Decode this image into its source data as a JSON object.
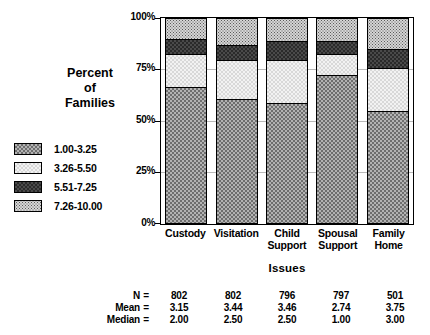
{
  "chart_data": {
    "type": "bar",
    "subtype": "stacked-bar-100-percent",
    "title": "",
    "xlabel": "Issues",
    "ylabel": "Percent of Families",
    "ylim": [
      0,
      100
    ],
    "ytick_labels": [
      "100%",
      "75%",
      "50%",
      "25%",
      "0%"
    ],
    "ytick_values": [
      100,
      75,
      50,
      25,
      0
    ],
    "grid": true,
    "legend_position": "left",
    "categories": [
      "Custody",
      "Visitation",
      "Child Support",
      "Spousal Support",
      "Family Home"
    ],
    "category_lines": [
      [
        "Custody"
      ],
      [
        "Visitation"
      ],
      [
        "Child",
        "Support"
      ],
      [
        "Spousal",
        "Support"
      ],
      [
        "Family",
        "Home"
      ]
    ],
    "series": [
      {
        "name": "1.00-3.25",
        "pattern": "checker-medium",
        "values": [
          67,
          61,
          59,
          73,
          55
        ]
      },
      {
        "name": "3.26-5.50",
        "pattern": "checker-light",
        "values": [
          16,
          19,
          21,
          10,
          21
        ]
      },
      {
        "name": "5.51-7.25",
        "pattern": "checker-dark",
        "values": [
          7,
          7,
          9,
          6,
          9
        ]
      },
      {
        "name": "7.26-10.00",
        "pattern": "dotted-grid",
        "values": [
          10,
          13,
          11,
          11,
          15
        ]
      }
    ]
  },
  "legend": {
    "items": [
      {
        "label": "1.00-3.25"
      },
      {
        "label": "3.26-5.50"
      },
      {
        "label": "5.51-7.25"
      },
      {
        "label": "7.26-10.00"
      }
    ]
  },
  "stats": {
    "rows": [
      {
        "label": "N",
        "eq": "=",
        "values": [
          "802",
          "802",
          "796",
          "797",
          "501"
        ]
      },
      {
        "label": "Mean",
        "eq": "=",
        "values": [
          "3.15",
          "3.44",
          "3.46",
          "2.74",
          "3.75"
        ]
      },
      {
        "label": "Median",
        "eq": "=",
        "values": [
          "2.00",
          "2.50",
          "2.50",
          "1.00",
          "3.00"
        ]
      }
    ]
  },
  "axis": {
    "y_title_lines": [
      "Percent",
      "of",
      "Families"
    ],
    "x_title": "Issues"
  },
  "colors": {
    "axis": "#000000",
    "grid": "#b9b9b9",
    "band_1": "#b3b3b3",
    "band_2": "#f2f2f2",
    "band_3": "#4a4a4a",
    "band_4": "#d5d5d5"
  }
}
